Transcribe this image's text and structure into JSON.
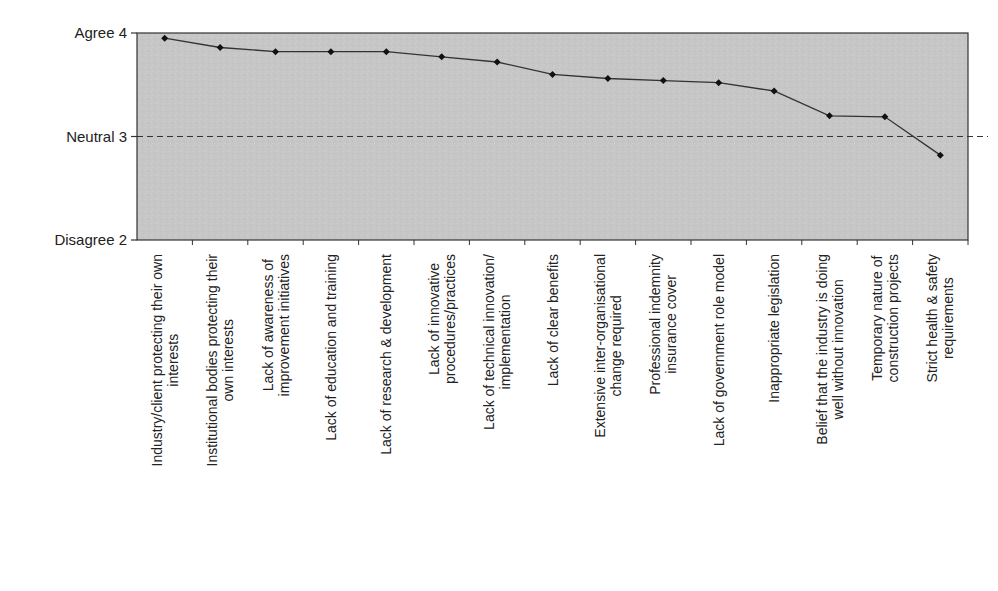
{
  "chart_data": {
    "type": "line",
    "title": "",
    "xlabel": "",
    "ylabel": "",
    "ylim": [
      2,
      4
    ],
    "yticks": [
      {
        "value": 4,
        "label": "Agree 4"
      },
      {
        "value": 3,
        "label": "Neutral 3"
      },
      {
        "value": 2,
        "label": "Disagree 2"
      }
    ],
    "reference_line": {
      "value": 3,
      "style": "dashed"
    },
    "grid": false,
    "legend": null,
    "categories": [
      [
        "Industry/client protecting their own",
        "interests"
      ],
      [
        "Institutional bodies protecting their",
        "own interests"
      ],
      [
        "Lack of awareness of",
        "improvement initiatives"
      ],
      [
        "Lack of education and training"
      ],
      [
        "Lack of research & development"
      ],
      [
        "Lack of innovative",
        "procedures/practices"
      ],
      [
        "Lack of technical innovation/",
        "implementation"
      ],
      [
        "Lack of clear benefits"
      ],
      [
        "Extensive inter-organisational",
        "change required"
      ],
      [
        "Professional indemnity",
        "insurance cover"
      ],
      [
        "Lack of government role model"
      ],
      [
        "Inappropriate legislation"
      ],
      [
        "Belief that the industry is doing",
        "well without innovation"
      ],
      [
        "Temporary nature of",
        "construction projects"
      ],
      [
        "Strict health & safety",
        "requirements"
      ]
    ],
    "series": [
      {
        "name": "Mean rating",
        "values": [
          3.95,
          3.86,
          3.82,
          3.82,
          3.82,
          3.77,
          3.72,
          3.6,
          3.56,
          3.54,
          3.52,
          3.44,
          3.2,
          3.19,
          2.82
        ]
      }
    ]
  },
  "colors": {
    "plot_background": "#c4c4c4",
    "line": "#333333",
    "marker": "#111111",
    "axis": "#333333",
    "reference_line": "#333333"
  }
}
